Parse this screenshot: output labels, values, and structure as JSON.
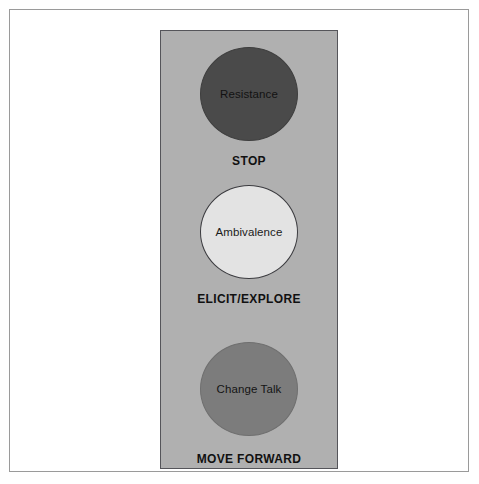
{
  "figure": {
    "panel": {
      "background_color": "#b0b0b0",
      "border_color": "#55555a"
    },
    "stages": [
      {
        "circle_label": "Resistance",
        "action_label": "STOP",
        "circle_color": "#4a4a4a",
        "icon": "traffic-light-red-circle"
      },
      {
        "circle_label": "Ambivalence",
        "action_label": "ELICIT/EXPLORE",
        "circle_color": "#e3e3e3",
        "icon": "traffic-light-amber-circle"
      },
      {
        "circle_label": "Change Talk",
        "action_label": "MOVE FORWARD",
        "circle_color": "#7c7c7c",
        "icon": "traffic-light-green-circle"
      }
    ]
  }
}
